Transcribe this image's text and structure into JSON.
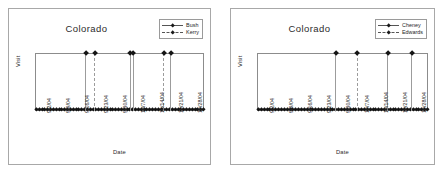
{
  "figure": {
    "panel_count": 2,
    "background": "#ffffff",
    "frame_color": "#a8a8a8"
  },
  "chart_data": [
    {
      "type": "line",
      "title": "Colorado",
      "xlabel": "Date",
      "ylabel": "Visit",
      "grid": false,
      "legend_position": "top-right",
      "xlim": [
        "9/2/04",
        "11/1/04"
      ],
      "ylim": [
        0,
        1
      ],
      "categories": [
        "9/2/04",
        "9/9/04",
        "9/16/04",
        "9/23/04",
        "9/30/04",
        "10/7/04",
        "10/14/04",
        "10/21/04",
        "10/28/04"
      ],
      "series": [
        {
          "name": "Bush",
          "style": "solid",
          "marker": "diamond",
          "color": "#9c9c9c",
          "spikes": [
            "9/13/04",
            "10/11/04",
            "10/12/04",
            "10/25/04"
          ],
          "values": [
            1,
            1,
            1,
            1
          ]
        },
        {
          "name": "Kerry",
          "style": "dashed",
          "marker": "diamond",
          "color": "#9c9c9c",
          "spikes": [
            "9/16/04",
            "10/21/04"
          ],
          "values": [
            1,
            1
          ]
        }
      ]
    },
    {
      "type": "line",
      "title": "Colorado",
      "xlabel": "Date",
      "ylabel": "Visit",
      "grid": false,
      "legend_position": "top-right",
      "xlim": [
        "9/2/04",
        "11/1/04"
      ],
      "ylim": [
        0,
        1
      ],
      "categories": [
        "9/2/04",
        "9/9/04",
        "9/16/04",
        "9/23/04",
        "9/30/04",
        "10/7/04",
        "10/14/04",
        "10/21/04",
        "10/28/04"
      ],
      "series": [
        {
          "name": "Cheney",
          "style": "solid",
          "marker": "diamond",
          "color": "#9c9c9c",
          "spikes": [
            "9/29/04",
            "10/20/04",
            "10/28/04"
          ],
          "values": [
            1,
            1,
            1
          ]
        },
        {
          "name": "Edwards",
          "style": "dashed",
          "marker": "diamond",
          "color": "#9c9c9c",
          "spikes": [
            "10/11/04"
          ],
          "values": [
            1
          ]
        }
      ]
    }
  ],
  "left_panel": {
    "title": "Colorado",
    "ylabel": "Visit",
    "xlabel": "Date",
    "legend": [
      {
        "label": "Bush",
        "style": "solid"
      },
      {
        "label": "Kerry",
        "style": "dashed"
      }
    ],
    "xticks": [
      "9/2/04",
      "9/9/04",
      "9/16/04",
      "9/23/04",
      "9/30/04",
      "10/7/04",
      "10/14/04",
      "10/21/04",
      "10/28/04"
    ],
    "spikes_solid_pct": [
      29.5,
      56.2,
      58.0,
      80.5
    ],
    "spikes_dashed_pct": [
      35.0,
      76.0
    ]
  },
  "right_panel": {
    "title": "Colorado",
    "ylabel": "Visit",
    "xlabel": "Date",
    "legend": [
      {
        "label": "Cheney",
        "style": "solid"
      },
      {
        "label": "Edwards",
        "style": "dashed"
      }
    ],
    "xticks": [
      "9/2/04",
      "9/9/04",
      "9/16/04",
      "9/23/04",
      "9/30/04",
      "10/7/04",
      "10/14/04",
      "10/21/04",
      "10/28/04"
    ],
    "spikes_solid_pct": [
      45.5,
      76.5,
      90.5
    ],
    "spikes_dashed_pct": [
      58.5
    ]
  }
}
